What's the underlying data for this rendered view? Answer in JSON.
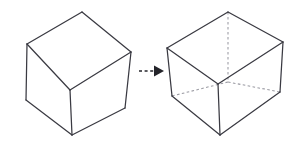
{
  "diagram": {
    "title": "Cube to transparent wireframe cube",
    "caption": "",
    "background_color": "#ffffff",
    "solid_edge_color": "#3a3a42",
    "hidden_edge_color": "#9a9aa2",
    "arrow_color": "#24242a",
    "shapes": [
      {
        "id": "solid-cube",
        "label": "Solid cube",
        "type": "cube-opaque",
        "hidden_edges_visible": false,
        "vertices": {
          "top_back": [
            82,
            12
          ],
          "top_left": [
            27,
            44
          ],
          "top_right": [
            131,
            52
          ],
          "front_center": [
            70,
            90
          ],
          "bottom_left": [
            26,
            100
          ],
          "bottom_right": [
            125,
            108
          ],
          "bottom_front": [
            72,
            135
          ]
        }
      },
      {
        "id": "wireframe-cube",
        "label": "Transparent wireframe cube",
        "type": "cube-wireframe",
        "hidden_edges_visible": true,
        "vertices": {
          "top_back": [
            228,
            12
          ],
          "top_left": [
            167,
            48
          ],
          "top_right": [
            283,
            42
          ],
          "front_center": [
            218,
            84
          ],
          "bottom_left": [
            172,
            96
          ],
          "bottom_right": [
            280,
            92
          ],
          "bottom_front": [
            220,
            135
          ],
          "hidden_back_bottom": [
            228,
            82
          ]
        }
      }
    ],
    "arrow": {
      "id": "transform-arrow",
      "label": "transforms into",
      "style": "dashed-with-solid-head",
      "from": [
        139,
        71
      ],
      "to": [
        162,
        71
      ]
    }
  }
}
